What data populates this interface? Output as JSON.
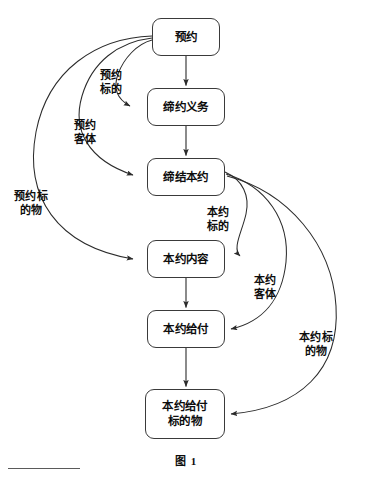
{
  "figure": {
    "caption": "图 1",
    "width": 372,
    "height": 485,
    "stroke_color": "#3a3a3a",
    "text_color": "#0d0d0d",
    "background_color": "#ffffff"
  },
  "nodes": [
    {
      "id": "yuyue",
      "label": "预约",
      "x": 152,
      "y": 18,
      "w": 68,
      "h": 38
    },
    {
      "id": "diyue-yiwu",
      "label": "缔约义务",
      "x": 147,
      "y": 88,
      "w": 78,
      "h": 38
    },
    {
      "id": "dijie-benyue",
      "label": "缔结本约",
      "x": 147,
      "y": 158,
      "w": 78,
      "h": 38
    },
    {
      "id": "benyue-neirong",
      "label": "本约内容",
      "x": 147,
      "y": 240,
      "w": 78,
      "h": 38
    },
    {
      "id": "benyue-geifu",
      "label": "本约给付",
      "x": 147,
      "y": 310,
      "w": 78,
      "h": 38
    },
    {
      "id": "benyue-geifu-biaodewu",
      "label": "本约给付\n标的物",
      "x": 145,
      "y": 389,
      "w": 80,
      "h": 50
    }
  ],
  "edge_labels": [
    {
      "id": "yuyue-biaode",
      "text": "预约\n标的",
      "x": 100,
      "y": 69
    },
    {
      "id": "yuyue-keti",
      "text": "预约\n客体",
      "x": 74,
      "y": 119
    },
    {
      "id": "yuyue-biaodewu",
      "text": "预约标\n的物",
      "x": 14,
      "y": 190
    },
    {
      "id": "benyue-biaode",
      "text": "本约\n标的",
      "x": 207,
      "y": 206
    },
    {
      "id": "benyue-keti",
      "text": "本约\n客体",
      "x": 254,
      "y": 274
    },
    {
      "id": "benyue-biaodewu",
      "text": "本约标\n的物",
      "x": 299,
      "y": 331
    }
  ],
  "edges": [
    {
      "id": "arrow-yuyue-to-diyue-yiwu",
      "from": "预约",
      "to": "缔约义务",
      "kind": "straight-down"
    },
    {
      "id": "arrow-diyue-yiwu-to-dijie-benyue",
      "from": "缔约义务",
      "to": "缔结本约",
      "kind": "straight-down"
    },
    {
      "id": "arrow-benyue-neirong-to-geifu",
      "from": "本约内容",
      "to": "本约给付",
      "kind": "straight-down"
    },
    {
      "id": "arrow-geifu-to-geifu-biaodewu",
      "from": "本约给付",
      "to": "本约给付标的物",
      "kind": "straight-down"
    },
    {
      "id": "curve-yuyue-to-diyue-yiwu",
      "from": "预约",
      "to": "缔约义务",
      "kind": "curve-left",
      "label": "预约标的"
    },
    {
      "id": "curve-yuyue-to-dijie-benyue",
      "from": "预约",
      "to": "缔结本约",
      "kind": "curve-left",
      "label": "预约客体"
    },
    {
      "id": "curve-yuyue-to-benyue-neirong",
      "from": "预约",
      "to": "本约内容",
      "kind": "curve-left",
      "label": "预约标的物"
    },
    {
      "id": "curve-dijie-to-benyue-neirong",
      "from": "缔结本约",
      "to": "本约内容",
      "kind": "curve-right",
      "label": "本约标的"
    },
    {
      "id": "curve-dijie-to-benyue-geifu",
      "from": "缔结本约",
      "to": "本约给付",
      "kind": "curve-right",
      "label": "本约客体"
    },
    {
      "id": "curve-dijie-to-geifu-biaodewu",
      "from": "缔结本约",
      "to": "本约给付标的物",
      "kind": "curve-right",
      "label": "本约标的物"
    }
  ],
  "footnote_rule": {
    "x": 8,
    "y": 468,
    "width": 72
  }
}
